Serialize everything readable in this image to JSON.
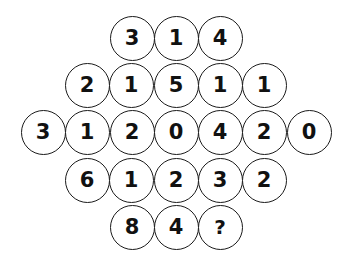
{
  "puzzle": {
    "name": "number-circle-diamond-grid",
    "background_color": "#ffffff",
    "circle_fill": "#ffffff",
    "circle_stroke_color": "#1a1a1a",
    "digit_color": "#111111",
    "unknown_symbol": "?",
    "circle_diameter": 45,
    "column_pitch": 44.4,
    "row_pitch": 47,
    "rows": [
      {
        "index": 0,
        "y": 38,
        "x_start": 132,
        "cells": [
          {
            "value": "3",
            "x": 132
          },
          {
            "value": "1",
            "x": 176
          },
          {
            "value": "4",
            "x": 220
          }
        ]
      },
      {
        "index": 1,
        "y": 85,
        "x_start": 87,
        "cells": [
          {
            "value": "2",
            "x": 87
          },
          {
            "value": "1",
            "x": 131
          },
          {
            "value": "5",
            "x": 176
          },
          {
            "value": "1",
            "x": 220
          },
          {
            "value": "1",
            "x": 264
          }
        ]
      },
      {
        "index": 2,
        "y": 132,
        "x_start": 43,
        "cells": [
          {
            "value": "3",
            "x": 43
          },
          {
            "value": "1",
            "x": 87
          },
          {
            "value": "2",
            "x": 132
          },
          {
            "value": "0",
            "x": 176
          },
          {
            "value": "4",
            "x": 220
          },
          {
            "value": "2",
            "x": 264
          },
          {
            "value": "0",
            "x": 309
          }
        ]
      },
      {
        "index": 3,
        "y": 180,
        "x_start": 87,
        "cells": [
          {
            "value": "6",
            "x": 87
          },
          {
            "value": "1",
            "x": 131
          },
          {
            "value": "2",
            "x": 176
          },
          {
            "value": "3",
            "x": 220
          },
          {
            "value": "2",
            "x": 264
          }
        ]
      },
      {
        "index": 4,
        "y": 227,
        "x_start": 132,
        "cells": [
          {
            "value": "8",
            "x": 132
          },
          {
            "value": "4",
            "x": 176
          },
          {
            "value": "?",
            "x": 220
          }
        ]
      }
    ]
  }
}
